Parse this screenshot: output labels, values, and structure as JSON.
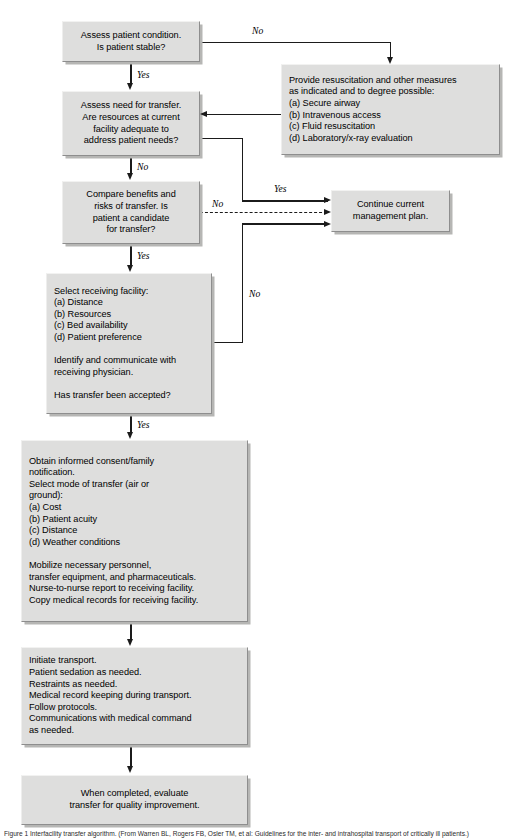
{
  "diagram": {
    "background_color": "#ffffff",
    "box_fill_color": "#dededd",
    "box_border_color": "#8e8e8e",
    "line_color": "#1b1b1b"
  },
  "nodes": {
    "assess_condition": "Assess patient condition.\nIs patient stable?",
    "resuscitation": "Provide resuscitation and other measures\nas indicated and to degree possible:\n (a) Secure airway\n (b) Intravenous access\n (c) Fluid resuscitation\n (d) Laboratory/x-ray evaluation",
    "assess_need": "Assess need for transfer.\nAre resources at current\nfacility adequate to\naddress patient needs?",
    "compare_benefits": "Compare benefits and\nrisks of transfer. Is\npatient a candidate\nfor transfer?",
    "continue_plan": "Continue current\nmanagement plan.",
    "select_facility": "Select receiving facility:\n (a) Distance\n (b) Resources\n (c) Bed availability\n (d) Patient preference\n\nIdentify and communicate with\nreceiving physician.\n\nHas transfer been accepted?",
    "obtain_consent": "Obtain informed consent/family\nnotification.\nSelect mode of transfer (air or\nground):\n (a) Cost\n (b) Patient acuity\n (c) Distance\n (d) Weather conditions\n\nMobilize necessary personnel,\ntransfer equipment, and pharmaceuticals.\nNurse-to-nurse report to receiving facility.\nCopy medical records for receiving facility.",
    "initiate_transport": "Initiate transport.\n  Patient sedation as needed.\n  Restraints as needed.\nMedical record keeping during transport.\nFollow protocols.\nCommunications with medical command\nas needed.",
    "evaluate_quality": "When completed, evaluate\ntransfer for quality improvement."
  },
  "edge_labels": {
    "no_top": "No",
    "yes_stable": "Yes",
    "no_need": "No",
    "yes_adequate": "Yes",
    "no_candidate": "No",
    "yes_candidate": "Yes",
    "no_accepted": "No"
  },
  "caption": {
    "text": "Figure 1  Interfacility transfer algorithm. (From Warren BL, Rogers FB, Osler TM, et al: Guidelines for the inter- and intrahospital transport of critically ill patients.)"
  }
}
